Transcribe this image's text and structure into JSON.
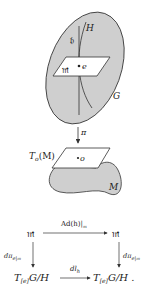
{
  "figure": {
    "group_label": "G",
    "subgroup_label": "H",
    "subalgebra_label": "𝔥",
    "complement_label": "𝔪",
    "identity_label": "e",
    "projection_label": "π",
    "tangent_space_label": "T",
    "tangent_space_sub": "o",
    "tangent_space_arg": "(M)",
    "origin_label": "o",
    "manifold_label": "M"
  },
  "commutative_diagram": {
    "top_left": "𝔪",
    "top_right": "𝔪",
    "top_arrow": "Ad(h)|",
    "top_arrow_sub": "𝔪",
    "left_arrow": "dπ",
    "left_arrow_sub": "e|𝔪",
    "right_arrow": "dπ",
    "right_arrow_sub": "e|𝔪",
    "bottom_arrow": "dl",
    "bottom_arrow_sub": "h",
    "bottom_left_T": "T",
    "bottom_left_sub": "[e]",
    "bottom_left_rest": "G/H",
    "bottom_right_T": "T",
    "bottom_right_sub": "[e]",
    "bottom_right_rest": "G/H ."
  },
  "colors": {
    "fill_gray": "#cfcfcf",
    "stroke": "#333333",
    "background": "#ffffff"
  }
}
